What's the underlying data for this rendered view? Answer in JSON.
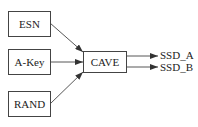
{
  "diagram": {
    "inputs": [
      {
        "label": "ESN"
      },
      {
        "label": "A-Key"
      },
      {
        "label": "RAND"
      }
    ],
    "process": {
      "label": "CAVE"
    },
    "outputs": [
      {
        "label": "SSD_A"
      },
      {
        "label": "SSD_B"
      }
    ],
    "edges": [
      {
        "from": "ESN",
        "to": "CAVE"
      },
      {
        "from": "A-Key",
        "to": "CAVE"
      },
      {
        "from": "RAND",
        "to": "CAVE"
      },
      {
        "from": "CAVE",
        "to": "SSD_A"
      },
      {
        "from": "CAVE",
        "to": "SSD_B"
      }
    ],
    "colors": {
      "stroke": "#444444",
      "background": "#ffffff",
      "text": "#222222"
    }
  }
}
